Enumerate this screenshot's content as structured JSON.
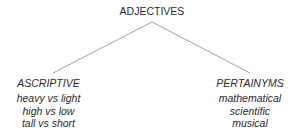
{
  "root": {
    "label": "ADJECTIVES"
  },
  "branches": [
    {
      "label": "ASCRIPTIVE",
      "examples": [
        "heavy vs light",
        "high vs low",
        "tall vs short"
      ]
    },
    {
      "label": "PERTAINYMS",
      "examples": [
        "mathematical",
        "scientific",
        "musical"
      ]
    }
  ],
  "colors": {
    "line": "#8a8a8a",
    "text": "#2a2a2a"
  }
}
